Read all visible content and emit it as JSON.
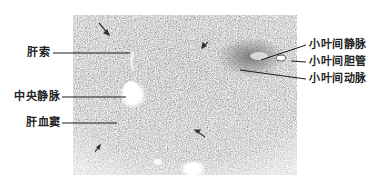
{
  "figure": {
    "labels_left": [
      {
        "id": "hepatic-cord",
        "text": "肝索"
      },
      {
        "id": "central-vein",
        "text": "中央静脉"
      },
      {
        "id": "hepatic-sinusoid",
        "text": "肝血窦"
      }
    ],
    "labels_right": [
      {
        "id": "interlobular-vein",
        "text": "小叶间静脉"
      },
      {
        "id": "interlobular-bile-duct",
        "text": "小叶间胆管"
      },
      {
        "id": "interlobular-artery",
        "text": "小叶间动脉"
      }
    ],
    "colors": {
      "tissue_dark": "#8c8c8c",
      "tissue_light": "#d6d6d6",
      "lumen": "#ffffff",
      "line": "#1a1a1a"
    }
  }
}
